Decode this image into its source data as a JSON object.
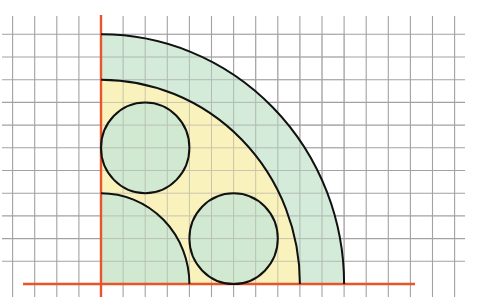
{
  "diagram": {
    "type": "geometry-quarter-circles-on-grid",
    "units": "grid squares",
    "origin": {
      "x": 0,
      "y": 0
    },
    "grid": {
      "columns_left_of_axis": 4,
      "columns_right_of_axis": 16,
      "rows_above_axis": 11,
      "rows_below_axis": 0.6
    },
    "shapes": {
      "outer_quarter_circle": {
        "center": [
          0,
          0
        ],
        "radius": 11,
        "fill": "green"
      },
      "middle_quarter_circle": {
        "center": [
          0,
          0
        ],
        "radius": 9,
        "fill": "yellow"
      },
      "inner_quarter_circle": {
        "center": [
          0,
          0
        ],
        "radius": 4,
        "fill": "green"
      },
      "small_circle_top": {
        "center": [
          2,
          6
        ],
        "radius": 2,
        "fill": "green"
      },
      "small_circle_right": {
        "center": [
          6,
          2
        ],
        "radius": 2,
        "fill": "green"
      }
    }
  },
  "colors": {
    "background": "#ffffff",
    "grid_line": "#a2a2a2",
    "axis": "#e8552a",
    "outline": "#111111",
    "green_fill": "#cce8d2",
    "yellow_fill": "#fdf3b8"
  },
  "layout": {
    "origin_px": [
      101,
      284
    ],
    "unit_x_px": 22.1,
    "unit_y_px": 22.7
  }
}
